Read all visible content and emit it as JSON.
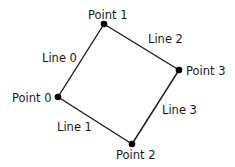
{
  "diagram": {
    "title": "",
    "colors": {
      "stroke": "#1a1a1a",
      "point": "#000000",
      "text": "#1a1a1a",
      "background": "#ffffff"
    },
    "points": [
      {
        "id": 0,
        "label": "Point 0",
        "x": 58,
        "y": 97
      },
      {
        "id": 1,
        "label": "Point 1",
        "x": 104,
        "y": 24
      },
      {
        "id": 2,
        "label": "Point 2",
        "x": 132,
        "y": 144
      },
      {
        "id": 3,
        "label": "Point 3",
        "x": 179,
        "y": 70
      }
    ],
    "lines": [
      {
        "id": 0,
        "label": "Line 0",
        "from": 0,
        "to": 1
      },
      {
        "id": 1,
        "label": "Line 1",
        "from": 0,
        "to": 2
      },
      {
        "id": 2,
        "label": "Line 2",
        "from": 1,
        "to": 3
      },
      {
        "id": 3,
        "label": "Line 3",
        "from": 2,
        "to": 3
      }
    ]
  }
}
